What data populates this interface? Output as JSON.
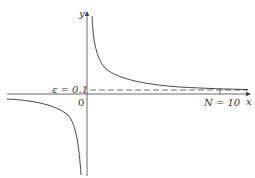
{
  "diagram": {
    "type": "function-graph",
    "function": "y = 1/x",
    "axes": {
      "x_label": "x",
      "y_label": "y",
      "origin_label": "0"
    },
    "annotations": {
      "epsilon_label": "ε = 0.1",
      "N_label": "N = 10"
    },
    "epsilon": 0.1,
    "N": 10,
    "colors": {
      "curve": "#333333",
      "axes": "#444444",
      "dashed": "#444444"
    }
  }
}
